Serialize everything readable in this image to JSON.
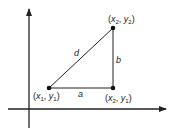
{
  "diagram": {
    "title": "",
    "points": [
      {
        "id": "p1",
        "label_x": "x",
        "sub_x": "1",
        "label_y": "y",
        "sub_y": "1",
        "cx": 49,
        "cy": 88
      },
      {
        "id": "p2",
        "label_x": "x",
        "sub_x": "2",
        "label_y": "y",
        "sub_y": "1",
        "cx": 113,
        "cy": 88
      },
      {
        "id": "p3",
        "label_x": "x",
        "sub_x": "2",
        "label_y": "y",
        "sub_y": "2",
        "cx": 113,
        "cy": 28
      }
    ],
    "segments": {
      "a": "a",
      "b": "b",
      "d": "d"
    },
    "colors": {
      "line": "#222222",
      "background": "#ffffff"
    }
  }
}
